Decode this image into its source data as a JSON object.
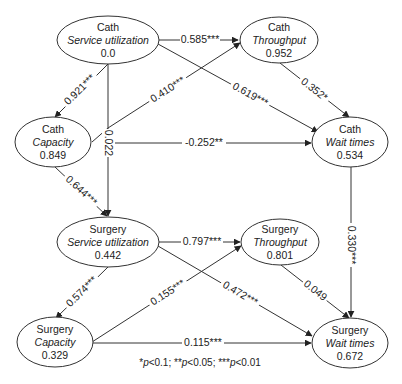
{
  "nodes": {
    "cath_service": {
      "group": "Cath",
      "name": "Service utilization",
      "value": "0.0"
    },
    "cath_throughput": {
      "group": "Cath",
      "name": "Throughput",
      "value": "0.952"
    },
    "cath_capacity": {
      "group": "Cath",
      "name": "Capacity",
      "value": "0.849"
    },
    "cath_wait": {
      "group": "Cath",
      "name": "Wait times",
      "value": "0.534"
    },
    "surg_service": {
      "group": "Surgery",
      "name": "Service utilization",
      "value": "0.442"
    },
    "surg_throughput": {
      "group": "Surgery",
      "name": "Throughput",
      "value": "0.801"
    },
    "surg_capacity": {
      "group": "Surgery",
      "name": "Capacity",
      "value": "0.329"
    },
    "surg_wait": {
      "group": "Surgery",
      "name": "Wait times",
      "value": "0.672"
    }
  },
  "edges": {
    "cs_ct": "0.585***",
    "cs_cc": "0.921***",
    "cs_cw": "0.619***",
    "cs_ss": "0.022",
    "cc_ct": "0.410***",
    "cc_cw": "-0.252**",
    "cc_ss": "0.644***",
    "ct_cw": "0.352*",
    "cw_sw": "0.330***",
    "ss_st": "0.797***",
    "ss_sc": "0.574***",
    "ss_sw": "0.472***",
    "sc_st": "0.155***",
    "sc_sw": "0.115***",
    "st_sw": "0.049"
  },
  "footnote": {
    "s1": "*",
    "p1": "p",
    "t1": "<0.1; ",
    "s2": "**",
    "p2": "p",
    "t2": "<0.05; ",
    "s3": "***",
    "p3": "p",
    "t3": "<0.01"
  }
}
